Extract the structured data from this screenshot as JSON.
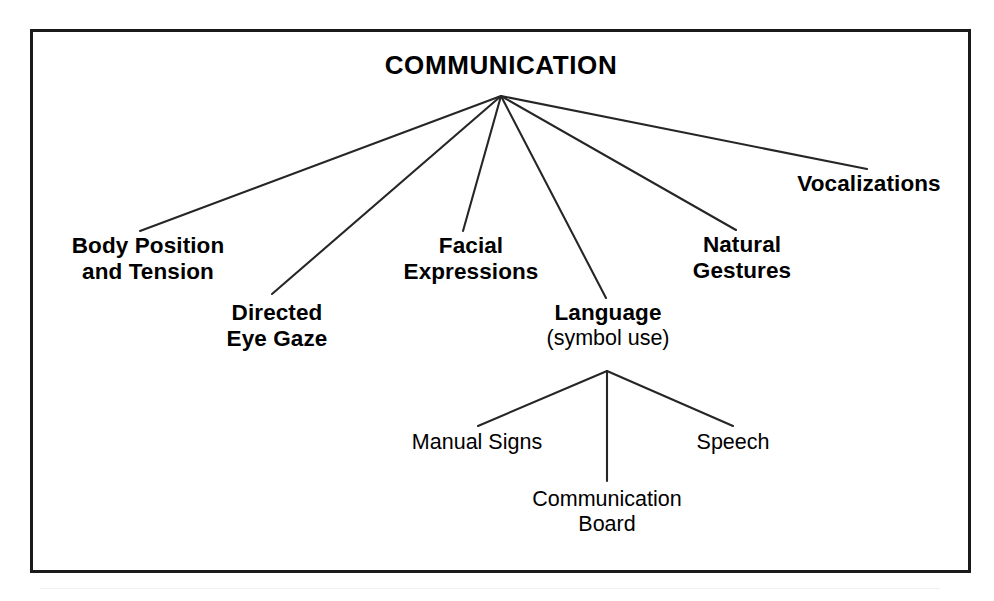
{
  "diagram": {
    "type": "hierarchy-tree",
    "title": "COMMUNICATION",
    "root": {
      "id": "communication",
      "label": "COMMUNICATION",
      "level": 0,
      "bold": true
    },
    "branches": [
      {
        "id": "body-position-and-tension",
        "lines": [
          "Body Position",
          "and Tension"
        ],
        "level": 1,
        "bold": true
      },
      {
        "id": "directed-eye-gaze",
        "lines": [
          "Directed",
          "Eye Gaze"
        ],
        "level": 1,
        "bold": true
      },
      {
        "id": "facial-expressions",
        "lines": [
          "Facial",
          "Expressions"
        ],
        "level": 1,
        "bold": true
      },
      {
        "id": "language",
        "lines": [
          "Language"
        ],
        "sublabel": "(symbol use)",
        "level": 1,
        "bold": true,
        "children": [
          {
            "id": "manual-signs",
            "lines": [
              "Manual Signs"
            ],
            "level": 2,
            "bold": false
          },
          {
            "id": "communication-board",
            "lines": [
              "Communication",
              "Board"
            ],
            "level": 2,
            "bold": false
          },
          {
            "id": "speech",
            "lines": [
              "Speech"
            ],
            "level": 2,
            "bold": false
          }
        ]
      },
      {
        "id": "natural-gestures",
        "lines": [
          "Natural",
          "Gestures"
        ],
        "level": 1,
        "bold": true
      },
      {
        "id": "vocalizations",
        "lines": [
          "Vocalizations"
        ],
        "level": 1,
        "bold": true
      }
    ]
  },
  "nodes": {
    "root": {
      "line1": "COMMUNICATION"
    },
    "body_position": {
      "line1": "Body Position",
      "line2": "and Tension"
    },
    "directed_eye_gaze": {
      "line1": "Directed",
      "line2": "Eye Gaze"
    },
    "facial_expressions": {
      "line1": "Facial",
      "line2": "Expressions"
    },
    "language": {
      "line1": "Language",
      "line2": "(symbol use)"
    },
    "natural_gestures": {
      "line1": "Natural",
      "line2": "Gestures"
    },
    "vocalizations": {
      "line1": "Vocalizations"
    },
    "manual_signs": {
      "line1": "Manual Signs"
    },
    "communication_board": {
      "line1": "Communication",
      "line2": "Board"
    },
    "speech": {
      "line1": "Speech"
    }
  },
  "style": {
    "ink": "#000000",
    "frame_color": "#1a1a1a",
    "background": "#ffffff",
    "edge_color": "#262626"
  }
}
